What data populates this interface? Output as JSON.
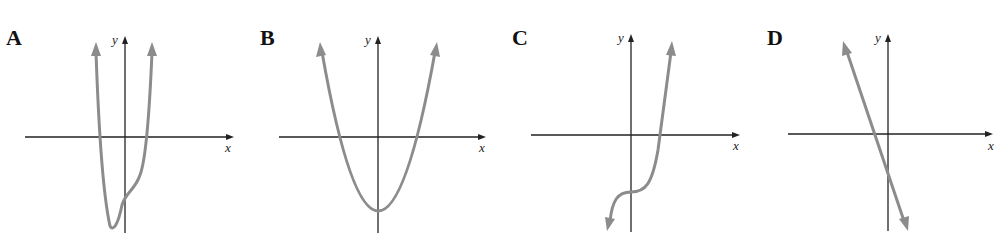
{
  "figure": {
    "colors": {
      "curve": "#8c8c8c",
      "axis": "#222222",
      "label": "#111111"
    },
    "panels": [
      {
        "label": "A",
        "x_axis_label": "x",
        "y_axis_label": "y",
        "description": "quartic-like curve, both ends up, minimum left of y-axis, flattening near negative y-intercept"
      },
      {
        "label": "B",
        "x_axis_label": "x",
        "y_axis_label": "y",
        "description": "upward parabola with vertex on negative y-axis"
      },
      {
        "label": "C",
        "x_axis_label": "x",
        "y_axis_label": "y",
        "description": "increasing cubic with inflection point on negative y-axis"
      },
      {
        "label": "D",
        "x_axis_label": "x",
        "y_axis_label": "y",
        "description": "decreasing straight line with negative x- and y-intercepts"
      }
    ]
  }
}
